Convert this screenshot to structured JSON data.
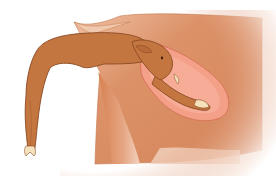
{
  "illustration": {
    "subject": "calf-in-birth-canal-diagram",
    "colors": {
      "background": "#ffffff",
      "cow_body": "#d9895f",
      "cow_body_light": "#efc2a6",
      "cow_outline": "#b8683f",
      "uterus": "#f4a088",
      "uterus_outline": "#d9745a",
      "calf_body": "#c47640",
      "calf_outline": "#8a4a22",
      "hoof": "#f5e2bc",
      "eye": "#3a1a0a"
    }
  }
}
